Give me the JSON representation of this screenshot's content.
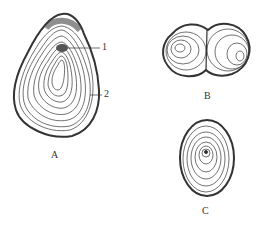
{
  "figure": {
    "panels": [
      {
        "id": "A",
        "label": "A",
        "type": "eccentric simple grain"
      },
      {
        "id": "B",
        "label": "B",
        "type": "compound grain"
      },
      {
        "id": "C",
        "label": "C",
        "type": "concentric simple grain"
      }
    ],
    "callouts": [
      {
        "number": "1",
        "target": "hilum"
      },
      {
        "number": "2",
        "target": "growth rings"
      }
    ],
    "colors": {
      "ink": "#333333",
      "background": "#ffffff"
    }
  }
}
